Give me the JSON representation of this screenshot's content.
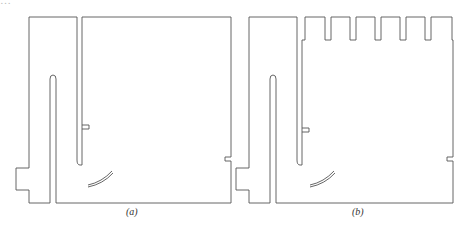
{
  "figure": {
    "panels": [
      {
        "label": "(a)",
        "has_castellations": false
      },
      {
        "label": "(b)",
        "has_castellations": true,
        "castellation_count": 6
      }
    ],
    "colors": {
      "stroke": "#555555",
      "background": "#ffffff"
    },
    "top_cropped_text": "…"
  }
}
